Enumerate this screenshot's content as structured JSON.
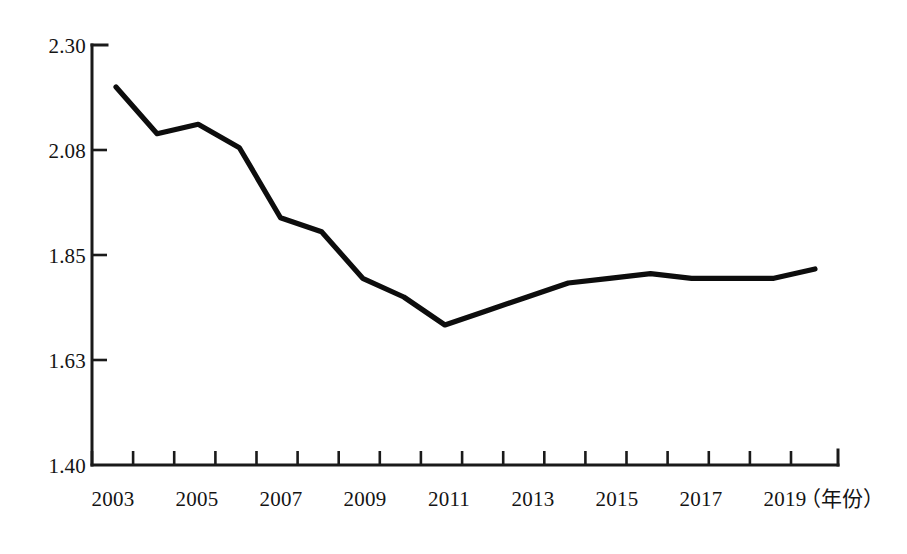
{
  "chart_data": {
    "type": "line",
    "title": "",
    "subtitle": "",
    "xlabel": "（年份）",
    "ylabel": "",
    "grid": false,
    "legend": null,
    "legend_position": "none",
    "xlim": [
      2003,
      2020
    ],
    "ylim": [
      1.4,
      2.3
    ],
    "x": [
      2003,
      2004,
      2005,
      2006,
      2007,
      2008,
      2009,
      2010,
      2011,
      2012,
      2013,
      2014,
      2015,
      2016,
      2017,
      2018,
      2019,
      2020
    ],
    "values": [
      2.21,
      2.11,
      2.13,
      2.08,
      1.93,
      1.9,
      1.8,
      1.76,
      1.7,
      1.73,
      1.76,
      1.79,
      1.8,
      1.81,
      1.8,
      1.8,
      1.8,
      1.82
    ],
    "x_tick_values": [
      2003,
      2004,
      2005,
      2006,
      2007,
      2008,
      2009,
      2010,
      2011,
      2012,
      2013,
      2014,
      2015,
      2016,
      2017,
      2018,
      2019,
      2020
    ],
    "x_tick_labels": [
      "2003",
      "",
      "2005",
      "",
      "2007",
      "",
      "2009",
      "",
      "2011",
      "",
      "2013",
      "",
      "2015",
      "",
      "2017",
      "",
      "2019",
      ""
    ],
    "y_tick_values": [
      1.4,
      1.63,
      1.85,
      2.08,
      2.3
    ],
    "y_tick_labels": [
      "1.40",
      "1.63",
      "1.85",
      "2.08",
      "2.30"
    ],
    "line_color": "#0d0d0d",
    "axis_color": "#1a1a1a",
    "background_color": "#ffffff"
  },
  "axis": {
    "y_labels": [
      "2.30",
      "2.08",
      "1.85",
      "1.63",
      "1.40"
    ],
    "x_labels": [
      "2003",
      "2005",
      "2007",
      "2009",
      "2011",
      "2013",
      "2015",
      "2017",
      "2019"
    ],
    "x_title": "（年份）"
  }
}
